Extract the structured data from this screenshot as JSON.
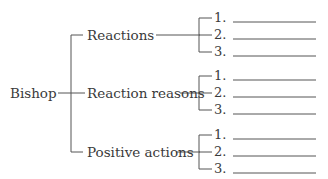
{
  "diagram": {
    "root": "Bishop",
    "branches": [
      {
        "label": "Reactions",
        "items": [
          "1.",
          "2.",
          "3."
        ]
      },
      {
        "label": "Reaction reasons",
        "items": [
          "1.",
          "2.",
          "3."
        ]
      },
      {
        "label": "Positive actions",
        "items": [
          "1.",
          "2.",
          "3."
        ]
      }
    ],
    "line_color": "#555555"
  }
}
